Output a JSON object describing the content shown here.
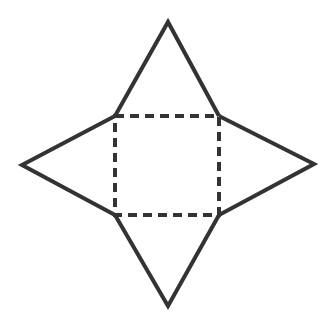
{
  "diagram": {
    "colors": {
      "stroke": "#333333",
      "background": "#ffffff"
    },
    "base": {
      "shape": "square",
      "line_style": "dashed"
    },
    "faces": [
      {
        "name": "top",
        "shape": "triangle",
        "line_style": "solid"
      },
      {
        "name": "right",
        "shape": "triangle",
        "line_style": "solid"
      },
      {
        "name": "bottom",
        "shape": "triangle",
        "line_style": "solid"
      },
      {
        "name": "left",
        "shape": "triangle",
        "line_style": "solid"
      }
    ]
  }
}
